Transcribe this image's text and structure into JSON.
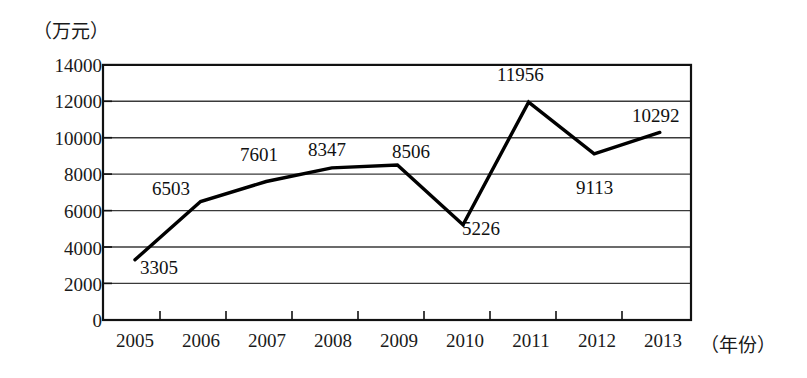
{
  "chart_data": {
    "type": "line",
    "title": "",
    "xlabel": "（年份）",
    "ylabel": "（万元）",
    "categories": [
      "2005",
      "2006",
      "2007",
      "2008",
      "2009",
      "2010",
      "2011",
      "2012",
      "2013"
    ],
    "values": [
      3305,
      6503,
      7601,
      8347,
      8506,
      5226,
      11956,
      9113,
      10292
    ],
    "ylim": [
      0,
      14000
    ],
    "yticks": [
      "0",
      "2000",
      "4000",
      "6000",
      "8000",
      "10000",
      "12000",
      "14000"
    ],
    "ytick_values": [
      0,
      2000,
      4000,
      6000,
      8000,
      10000,
      12000,
      14000
    ],
    "grid": true,
    "grid_axis": "y",
    "legend": "none",
    "series": [
      {
        "name": "",
        "color": "#000000",
        "values": [
          3305,
          6503,
          7601,
          8347,
          8506,
          5226,
          11956,
          9113,
          10292
        ]
      }
    ],
    "data_labels": [
      {
        "category": "2005",
        "value": 3305,
        "text": "3305"
      },
      {
        "category": "2006",
        "value": 6503,
        "text": "6503"
      },
      {
        "category": "2007",
        "value": 7601,
        "text": "7601"
      },
      {
        "category": "2008",
        "value": 8347,
        "text": "8347"
      },
      {
        "category": "2009",
        "value": 8506,
        "text": "8506"
      },
      {
        "category": "2010",
        "value": 5226,
        "text": "5226"
      },
      {
        "category": "2011",
        "value": 11956,
        "text": "11956"
      },
      {
        "category": "2012",
        "value": 9113,
        "text": "9113"
      },
      {
        "category": "2013",
        "value": 10292,
        "text": "10292"
      }
    ]
  },
  "axes": {
    "y_unit_label": "（万元）",
    "x_unit_label": "（年份）",
    "ytick_labels": [
      "14000",
      "12000",
      "10000",
      "8000",
      "6000",
      "4000",
      "2000",
      "0"
    ],
    "xtick_labels": [
      "2005",
      "2006",
      "2007",
      "2008",
      "2009",
      "2010",
      "2011",
      "2012",
      "2013"
    ]
  },
  "colors": {
    "line": "#000000",
    "grid": "#3a3a3a",
    "frame": "#111111",
    "text": "#1a1a1a",
    "background": "#ffffff"
  }
}
